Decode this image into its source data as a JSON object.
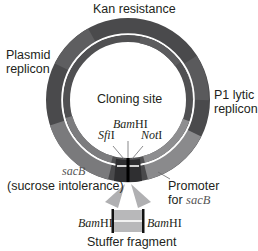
{
  "diagram": {
    "colors": {
      "ring_dark": "#4a4a4c",
      "ring_mid": "#6a6a6c",
      "ring_light": "#8c8c8e",
      "ring_separator": "#ffffff",
      "cloning_block": "#2e2e30",
      "site_line": "#000000",
      "stuffer_fill": "#b8b8ba",
      "funnel": "#b0b0b2"
    },
    "labels": {
      "kan": "Kan resistance",
      "plasmid_line1": "Plasmid",
      "plasmid_line2": "replicon",
      "p1_line1": "P1 lytic",
      "p1_line2": "replicon",
      "cloning_site": "Cloning site",
      "bamhi_top_italic": "Bam",
      "bamhi_top_roman": "HI",
      "sfi_italic": "Sfi",
      "sfi_roman": "I",
      "not_italic": "Not",
      "not_roman": "I",
      "sacb": "sacB",
      "sucrose": "(sucrose intolerance)",
      "promoter_line1": "Promoter",
      "promoter_line2_prefix": "for ",
      "promoter_line2_italic": "sacB",
      "bamhi_left_italic": "Bam",
      "bamhi_left_roman": "HI",
      "bamhi_right_italic": "Bam",
      "bamhi_right_roman": "HI",
      "stuffer": "Stuffer fragment"
    }
  }
}
